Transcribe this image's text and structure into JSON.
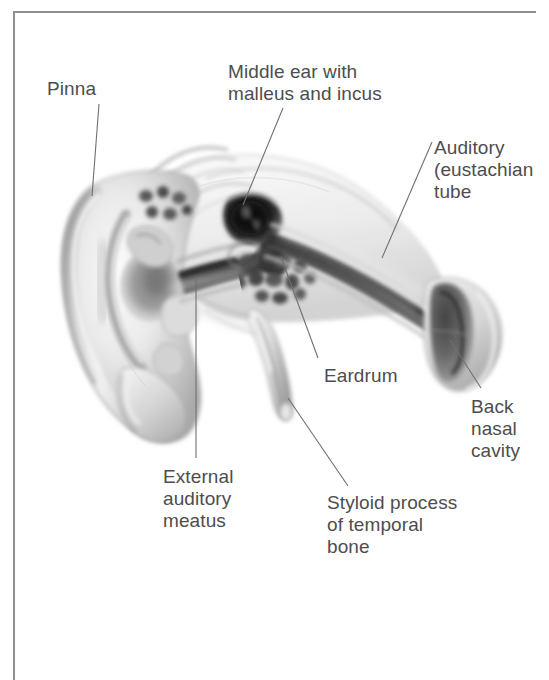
{
  "figure": {
    "background_color": "#ffffff",
    "frame_color": "#8d8f91",
    "label_color": "#4d4d4f",
    "leader_line_color": "#6e7073"
  },
  "labels": [
    {
      "id": "pinna",
      "name": "pinna-label",
      "lines": [
        "Pinna"
      ],
      "text": "Pinna"
    },
    {
      "id": "middle-ear",
      "name": "middle-ear-label",
      "lines": [
        "Middle ear with",
        "malleus and incus"
      ],
      "text": "Middle ear with\nmalleus and incus"
    },
    {
      "id": "auditory-tube",
      "name": "auditory-tube-label",
      "lines": [
        "Auditory",
        "(eustachian",
        "tube"
      ],
      "text": "Auditory\n(eustachian\ntube"
    },
    {
      "id": "eardrum",
      "name": "eardrum-label",
      "lines": [
        "Eardrum"
      ],
      "text": "Eardrum"
    },
    {
      "id": "back-nasal-cavity",
      "name": "back-nasal-cavity-label",
      "lines": [
        "Back",
        "nasal",
        "cavity"
      ],
      "text": "Back\nnasal\ncavity"
    },
    {
      "id": "external-auditory-meatus",
      "name": "external-auditory-meatus-label",
      "lines": [
        "External",
        "auditory",
        "meatus"
      ],
      "text": "External\nauditory\nmeatus"
    },
    {
      "id": "styloid-process",
      "name": "styloid-process-label",
      "lines": [
        "Styloid process",
        "of temporal",
        "bone"
      ],
      "text": "Styloid process\nof temporal\nbone"
    }
  ],
  "leader_lines": [
    {
      "id": "pinna",
      "x1": 99,
      "y1": 104,
      "x2": 92,
      "y2": 196
    },
    {
      "id": "middle-ear",
      "x1": 283,
      "y1": 108,
      "x2": 243,
      "y2": 205
    },
    {
      "id": "auditory-tube",
      "x1": 432,
      "y1": 142,
      "x2": 382,
      "y2": 258
    },
    {
      "id": "eardrum",
      "x1": 318,
      "y1": 358,
      "x2": 281,
      "y2": 257
    },
    {
      "id": "back-nasal-cavity",
      "x1": 481,
      "y1": 388,
      "x2": 450,
      "y2": 340
    },
    {
      "id": "external-auditory-meatus",
      "x1": 196,
      "y1": 458,
      "x2": 196,
      "y2": 278
    },
    {
      "id": "styloid-process",
      "x1": 348,
      "y1": 486,
      "x2": 288,
      "y2": 398
    }
  ],
  "structures": [
    {
      "id": "pinna",
      "label": "Pinna"
    },
    {
      "id": "ear-canal",
      "label": "External auditory meatus"
    },
    {
      "id": "tympanic-membrane",
      "label": "Eardrum"
    },
    {
      "id": "middle-ear-cavity",
      "label": "Middle ear with malleus and incus"
    },
    {
      "id": "mastoid-air-cells",
      "label": "Mastoid air cells"
    },
    {
      "id": "eustachian-tube",
      "label": "Auditory (eustachian) tube"
    },
    {
      "id": "nasopharynx",
      "label": "Back nasal cavity"
    },
    {
      "id": "styloid-process",
      "label": "Styloid process of temporal bone"
    }
  ]
}
